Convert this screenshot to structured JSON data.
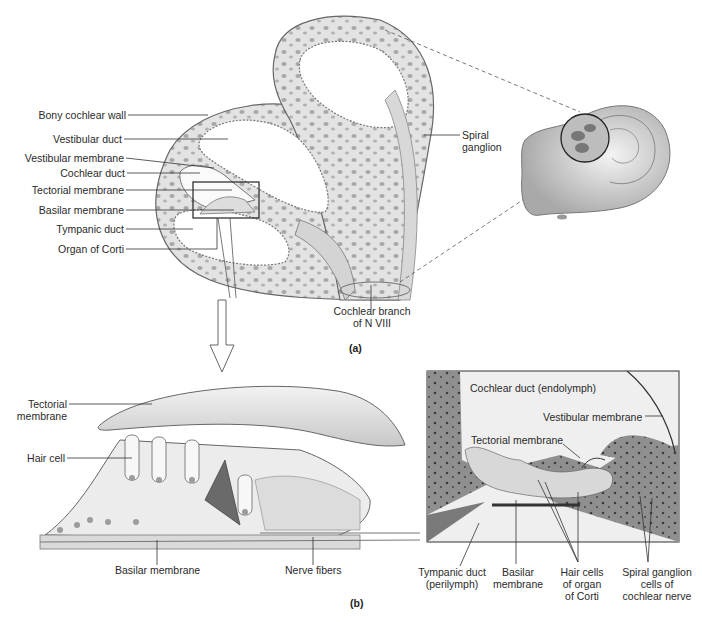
{
  "figure": {
    "panel_a_label": "(a)",
    "panel_b_label": "(b)"
  },
  "panel_a": {
    "left_labels": [
      "Bony cochlear wall",
      "Vestibular duct",
      "Vestibular membrane",
      "Cochlear duct",
      "Tectorial membrane",
      "Basilar membrane",
      "Tympanic duct",
      "Organ of Corti"
    ],
    "spiral_ganglion": "Spiral\nganglion",
    "cochlear_branch": "Cochlear branch\nof N VIII"
  },
  "panel_b_drawing": {
    "tectorial_membrane": "Tectorial\nmembrane",
    "hair_cell": "Hair cell",
    "basilar_membrane": "Basilar membrane",
    "nerve_fibers": "Nerve fibers"
  },
  "panel_b_micrograph": {
    "cochlear_duct": "Cochlear duct (endolymph)",
    "vestibular_membrane": "Vestibular membrane",
    "tectorial_membrane": "Tectorial membrane",
    "tympanic_duct": "Tympanic duct\n(perilymph)",
    "basilar_membrane": "Basilar\nmembrane",
    "hair_cells": "Hair cells\nof organ\nof Corti",
    "spiral_ganglion_cells": "Spiral ganglion\ncells of\ncochlear nerve"
  },
  "colors": {
    "bone": "#e6e6e6",
    "outline": "#555555",
    "micrograph_bg": "#efefef",
    "tissue": "#9a9a9a"
  }
}
